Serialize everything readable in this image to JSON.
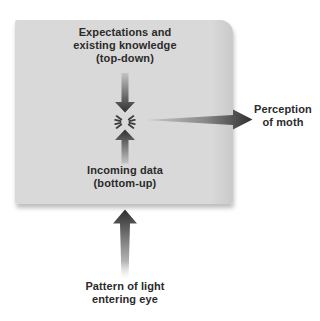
{
  "colors": {
    "background": "#ffffff",
    "box_fill": "#d9d9d9",
    "text": "#2b2b2b",
    "arrow_dark": "#2f2f2f",
    "arrow_light": "#c4c4c4",
    "starburst": "#3c3c3c"
  },
  "diagram": {
    "box_labels": {
      "top": [
        "Expectations and",
        "existing knowledge",
        "(top-down)"
      ],
      "bottom": [
        "Incoming data",
        "(bottom-up)"
      ]
    },
    "output_label": [
      "Perception",
      "of moth"
    ],
    "input_label": [
      "Pattern of light",
      "entering eye"
    ]
  }
}
